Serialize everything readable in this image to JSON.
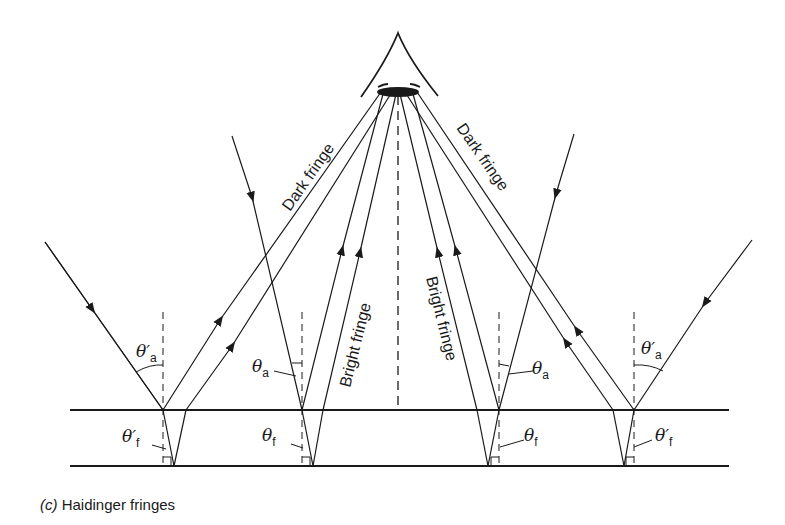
{
  "caption": {
    "part": "(c)",
    "text": "Haidinger fringes"
  },
  "labels": {
    "dark_fringe_left": "Dark fringe",
    "dark_fringe_right": "Dark fringe",
    "bright_fringe_left": "Bright fringe",
    "bright_fringe_right": "Bright fringe",
    "theta_a_prime_left": "θ′",
    "theta_a_prime_left_sub": "a",
    "theta_a_left": "θ",
    "theta_a_left_sub": "a",
    "theta_a_right": "θ",
    "theta_a_right_sub": "a",
    "theta_a_prime_right": "θ′",
    "theta_a_prime_right_sub": "a",
    "theta_f_prime_left": "θ′",
    "theta_f_prime_left_sub": "f",
    "theta_f_left": "θ",
    "theta_f_left_sub": "f",
    "theta_f_right": "θ",
    "theta_f_right_sub": "f",
    "theta_f_prime_right": "θ′",
    "theta_f_prime_right_sub": "f"
  },
  "colors": {
    "ink": "#1a1a1a",
    "background": "#ffffff"
  }
}
